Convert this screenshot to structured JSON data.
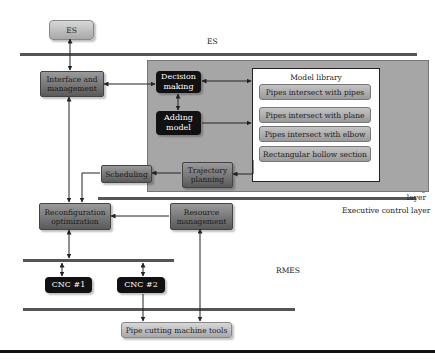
{
  "layers": {
    "es": "ES",
    "planning_line1": "Planning and",
    "planning_line2": "scheduling layer",
    "executive": "Executive control layer",
    "rmes": "RMES"
  },
  "nodes": {
    "es": "ES",
    "interface_line1": "Interface and",
    "interface_line2": "management",
    "decision_line1": "Decision",
    "decision_line2": "making",
    "adding_line1": "Adding",
    "adding_line2": "model",
    "scheduling": "Scheduling",
    "trajectory_line1": "Trajectory",
    "trajectory_line2": "planning",
    "reconfig_line1": "Reconfiguration",
    "reconfig_line2": "optimization",
    "resource_line1": "Resource",
    "resource_line2": "management",
    "cnc1": "CNC #1",
    "cnc2": "CNC #2",
    "pipe_tools": "Pipe cutting machine tools"
  },
  "model_library": {
    "title": "Model library",
    "items": [
      "Pipes intersect with pipes",
      "Pipes intersect with plane",
      "Pipes intersect with elbow",
      "Rectangular hollow section"
    ]
  },
  "colors": {
    "line": "#555555",
    "group_bg": "#a6a6a6",
    "black_box": "#111111"
  }
}
